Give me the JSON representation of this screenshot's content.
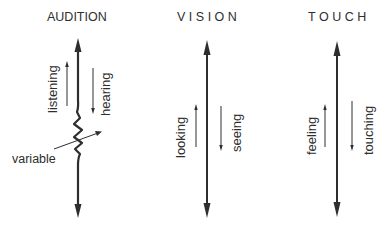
{
  "columns": [
    {
      "title": "AUDITION",
      "left_label": "listening",
      "right_label": "hearing",
      "side_label": "variable",
      "left_arrow_direction": "up",
      "right_arrow_direction": "down",
      "main_arrow": "bidirectional-with-variable-resistor"
    },
    {
      "title": "VISION",
      "left_label": "looking",
      "right_label": "seeing",
      "left_arrow_direction": "up",
      "right_arrow_direction": "down",
      "main_arrow": "bidirectional"
    },
    {
      "title": "TOUCH",
      "left_label": "feeling",
      "right_label": "touching",
      "left_arrow_direction": "up",
      "right_arrow_direction": "down",
      "main_arrow": "bidirectional"
    }
  ],
  "colors": {
    "ink": "#2e2e2e",
    "background": "#ffffff"
  }
}
